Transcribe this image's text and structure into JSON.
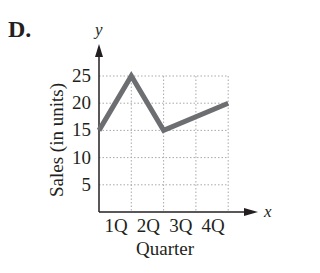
{
  "option_label": "D.",
  "chart_data": {
    "type": "line",
    "title": "",
    "xlabel": "Quarter",
    "ylabel": "Sales (in units)",
    "x_axis_name": "x",
    "y_axis_name": "y",
    "categories": [
      "1Q",
      "2Q",
      "3Q",
      "4Q"
    ],
    "x_ticks": [
      "1Q",
      "2Q",
      "3Q",
      "4Q"
    ],
    "y_ticks": [
      5,
      10,
      15,
      20,
      25
    ],
    "ylim": [
      0,
      25
    ],
    "grid": true,
    "legend": null,
    "series": [
      {
        "name": "Sales",
        "points": [
          {
            "x": 0,
            "y": 15
          },
          {
            "x": 1,
            "y": 25
          },
          {
            "x": 2,
            "y": 15
          },
          {
            "x": 4,
            "y": 20
          }
        ],
        "color": "#6d6e71"
      }
    ]
  },
  "colors": {
    "line": "#6d6e71",
    "axis": "#231f20",
    "grid": "#a7a9ac"
  }
}
